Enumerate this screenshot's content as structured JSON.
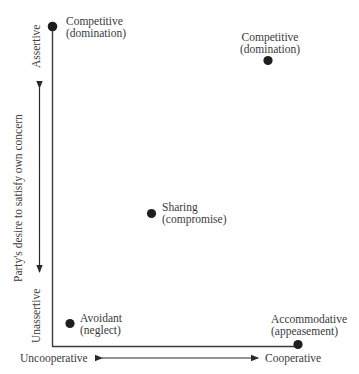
{
  "diagram": {
    "type": "conflict-handling-styles-grid",
    "y_axis": {
      "title": "Party's desire to satisfy own concern",
      "top_label": "Assertive",
      "bottom_label": "Unassertive"
    },
    "x_axis": {
      "left_label": "Uncooperative",
      "right_label": "Cooperative"
    },
    "points": [
      {
        "id": "competitive-top-left",
        "line1": "Competitive",
        "line2": "(domination)"
      },
      {
        "id": "competitive-top-right",
        "line1": "Competitive",
        "line2": "(domination)"
      },
      {
        "id": "sharing",
        "line1": "Sharing",
        "line2": "(compromise)"
      },
      {
        "id": "avoidant",
        "line1": "Avoidant",
        "line2": "(neglect)"
      },
      {
        "id": "accommodative",
        "line1": "Accommodative",
        "line2": "(appeasement)"
      }
    ],
    "colors": {
      "line": "#3a3a3a",
      "dot": "#1e1e1e",
      "text": "#3a3a3a",
      "background": "#ffffff"
    }
  }
}
